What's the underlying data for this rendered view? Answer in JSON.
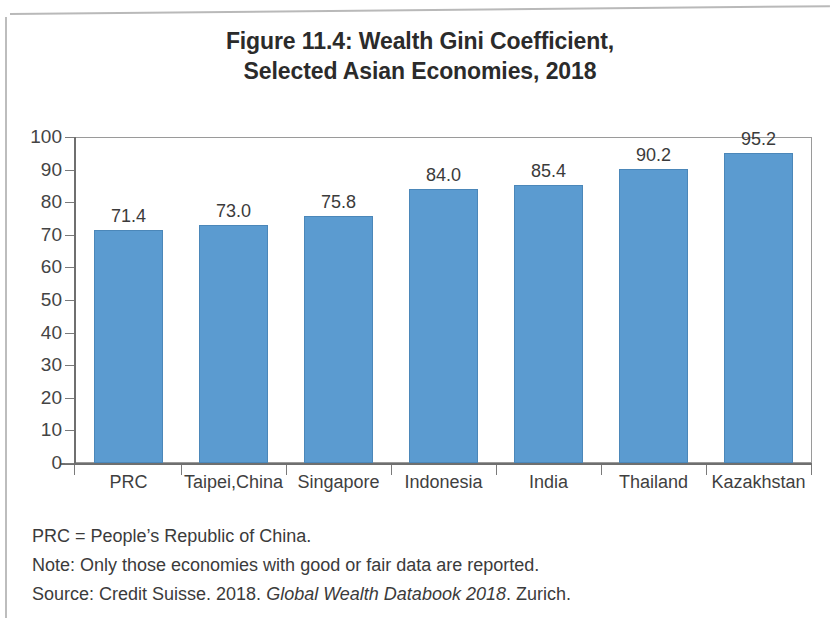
{
  "page": {
    "title_line_1": "Figure 11.4: Wealth Gini Coefficient,",
    "title_line_2": "Selected Asian Economies, 2018"
  },
  "chart_data": {
    "type": "bar",
    "title": "Figure 11.4: Wealth Gini Coefficient, Selected Asian Economies, 2018",
    "categories": [
      "PRC",
      "Taipei,China",
      "Singapore",
      "Indonesia",
      "India",
      "Thailand",
      "Kazakhstan"
    ],
    "values": [
      71.4,
      73.0,
      75.8,
      84.0,
      85.4,
      90.2,
      95.2
    ],
    "value_labels": [
      "71.4",
      "73.0",
      "75.8",
      "84.0",
      "85.4",
      "90.2",
      "95.2"
    ],
    "xlabel": "",
    "ylabel": "",
    "ylim": [
      0,
      100
    ],
    "ytick_labels": [
      "100",
      "90",
      "80",
      "70",
      "60",
      "50",
      "40",
      "30",
      "20",
      "10",
      "0"
    ],
    "ytick_values": [
      100,
      90,
      80,
      70,
      60,
      50,
      40,
      30,
      20,
      10,
      0
    ],
    "grid": false,
    "legend": false,
    "bar_color": "#5b9bd0"
  },
  "footnotes": {
    "abbreviation": "PRC = People’s Republic of China.",
    "note": "Note: Only those economies with good or fair data are reported.",
    "source_prefix": "Source: Credit Suisse. 2018. ",
    "source_italic": "Global Wealth Databook 2018",
    "source_suffix": ". Zurich."
  }
}
